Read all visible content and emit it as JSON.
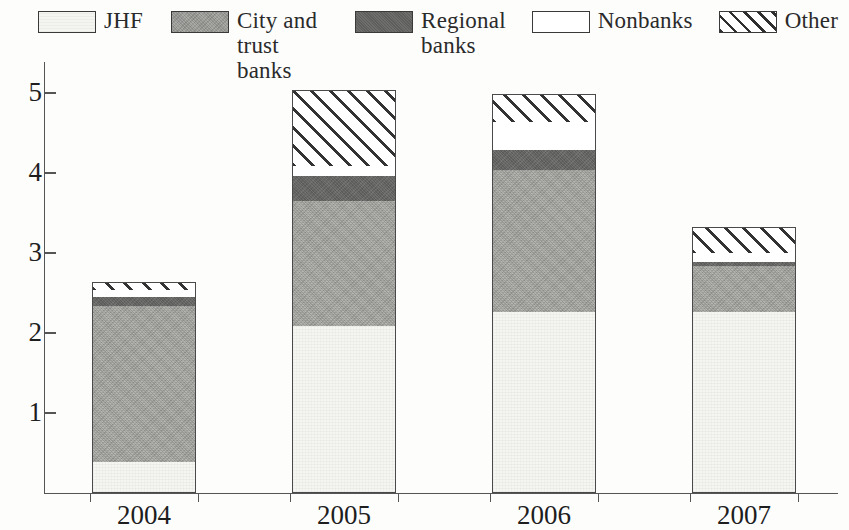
{
  "legend": {
    "position": "top",
    "entries": [
      {
        "label": "JHF",
        "key": "jhf",
        "swatch": "light-gray-fill-swatch"
      },
      {
        "label": "City and\ntrust banks",
        "key": "city",
        "swatch": "medium-gray-fill-swatch"
      },
      {
        "label": "Regional\nbanks",
        "key": "regional",
        "swatch": "dark-gray-fill-swatch"
      },
      {
        "label": "Nonbanks",
        "key": "nonbanks",
        "swatch": "white-fill-swatch"
      },
      {
        "label": "Other",
        "key": "other",
        "swatch": "diagonal-hatch-swatch"
      }
    ]
  },
  "axes": {
    "y_ticks": [
      "1",
      "2",
      "3",
      "4",
      "5"
    ],
    "x_ticks": [
      "2004",
      "2005",
      "2006",
      "2007"
    ]
  },
  "chart_data": {
    "type": "bar",
    "title": "",
    "subtitle": "",
    "xlabel": "",
    "ylabel": "",
    "stacked": true,
    "grid": false,
    "legend_position": "top",
    "categories": [
      "2004",
      "2005",
      "2006",
      "2007"
    ],
    "ylim": [
      0,
      5.4
    ],
    "yticks": [
      1,
      2,
      3,
      4,
      5
    ],
    "series": [
      {
        "name": "JHF",
        "values": [
          0.39,
          2.08,
          2.26,
          2.26
        ]
      },
      {
        "name": "City and trust banks",
        "values": [
          1.95,
          1.57,
          1.77,
          0.57
        ]
      },
      {
        "name": "Regional banks",
        "values": [
          0.11,
          0.31,
          0.25,
          0.05
        ]
      },
      {
        "name": "Nonbanks",
        "values": [
          0.09,
          0.12,
          0.35,
          0.12
        ]
      },
      {
        "name": "Other",
        "values": [
          0.1,
          0.95,
          0.35,
          0.32
        ]
      }
    ],
    "totals": [
      2.64,
      5.03,
      4.98,
      3.32
    ]
  },
  "colors": {
    "jhf": "#f5f5f2",
    "city": "#aaaaa6",
    "regional": "#5c5c5a",
    "nonbanks": "#ffffff",
    "other_hatch": "#333333",
    "axis": "#555555",
    "text": "#1e1e1e",
    "background": "#fdfdfc"
  }
}
